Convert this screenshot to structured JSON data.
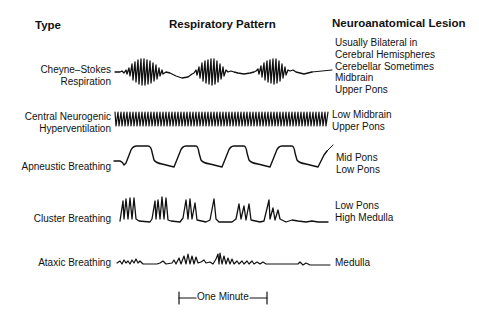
{
  "headers": {
    "type": "Type",
    "pattern": "Respiratory Pattern",
    "lesion": "Neuroanatomical Lesion"
  },
  "rows": [
    {
      "type_lines": [
        "Cheyne–Stokes",
        "Respiration"
      ],
      "pattern": "crescendo-decrescendo",
      "lesion_lines": [
        "Usually Bilateral in",
        "Cerebral Hemispheres",
        "Cerebellar Sometimes",
        "Midbrain",
        "Upper Pons"
      ]
    },
    {
      "type_lines": [
        "Central Neurogenic",
        "Hyperventilation"
      ],
      "pattern": "rapid-regular",
      "lesion_lines": [
        "Low Midbrain",
        "Upper Pons"
      ]
    },
    {
      "type_lines": [
        "Apneustic Breathing"
      ],
      "pattern": "inspiratory-pauses",
      "lesion_lines": [
        "Mid Pons",
        "Low Pons"
      ]
    },
    {
      "type_lines": [
        "Cluster Breathing"
      ],
      "pattern": "clusters-with-pauses",
      "lesion_lines": [
        "Low Pons",
        "High Medulla"
      ]
    },
    {
      "type_lines": [
        "Ataxic Breathing"
      ],
      "pattern": "irregular",
      "lesion_lines": [
        "Medulla"
      ]
    }
  ],
  "scale_bar": {
    "label": "One Minute"
  },
  "colors": {
    "ink": "#111111",
    "background": "#ffffff"
  }
}
